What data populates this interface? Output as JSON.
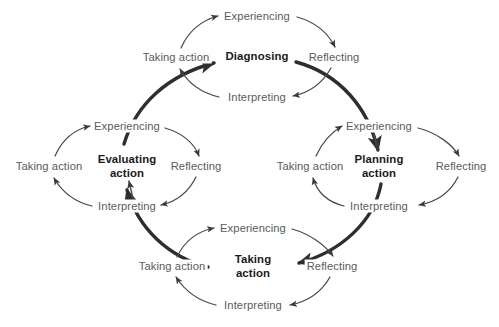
{
  "diagram": {
    "type": "action-learning-cycle-diagram",
    "background_color": "#ffffff",
    "label_color": "#5b5b5b",
    "core_label_color": "#1a1a1a",
    "stroke_color": "#3a3a3a",
    "outer_loop": {
      "name": "outer-action-learning-loop",
      "direction": "clockwise",
      "stages": [
        "Diagnosing",
        "Planning action",
        "Taking action",
        "Evaluating action"
      ]
    },
    "cycles": [
      {
        "id": "top",
        "core_line1": "Diagnosing",
        "core_line2": "",
        "center_x": 257,
        "center_y": 57,
        "labels": {
          "experiencing": "Experiencing",
          "reflecting": "Reflecting",
          "interpreting": "Interpreting",
          "taking_action": "Taking action"
        },
        "positions": {
          "experiencing_x": 257,
          "experiencing_y": 16,
          "reflecting_x": 334,
          "reflecting_y": 57,
          "interpreting_x": 257,
          "interpreting_y": 97,
          "taking_action_x": 176,
          "taking_action_y": 57
        }
      },
      {
        "id": "left",
        "core_line1": "Evaluating",
        "core_line2": "action",
        "center_x": 127,
        "center_y": 166,
        "labels": {
          "experiencing": "Experiencing",
          "reflecting": "Reflecting",
          "interpreting": "Interpreting",
          "taking_action": "Taking action"
        },
        "positions": {
          "experiencing_x": 127,
          "experiencing_y": 126,
          "reflecting_x": 196,
          "reflecting_y": 166,
          "interpreting_x": 127,
          "interpreting_y": 206,
          "taking_action_x": 49,
          "taking_action_y": 166
        }
      },
      {
        "id": "right",
        "core_line1": "Planning",
        "core_line2": "action",
        "center_x": 379,
        "center_y": 166,
        "labels": {
          "experiencing": "Experiencing",
          "reflecting": "Reflecting",
          "interpreting": "Interpreting",
          "taking_action": "Taking action"
        },
        "positions": {
          "experiencing_x": 379,
          "experiencing_y": 126,
          "reflecting_x": 461,
          "reflecting_y": 166,
          "interpreting_x": 379,
          "interpreting_y": 206,
          "taking_action_x": 310,
          "taking_action_y": 166
        }
      },
      {
        "id": "bottom",
        "core_line1": "Taking",
        "core_line2": "action",
        "center_x": 253,
        "center_y": 266,
        "labels": {
          "experiencing": "Experiencing",
          "reflecting": "Reflecting",
          "interpreting": "Interpreting",
          "taking_action": "Taking action"
        },
        "positions": {
          "experiencing_x": 253,
          "experiencing_y": 228,
          "reflecting_x": 332,
          "reflecting_y": 266,
          "interpreting_x": 253,
          "interpreting_y": 305,
          "taking_action_x": 172,
          "taking_action_y": 266
        }
      }
    ]
  }
}
